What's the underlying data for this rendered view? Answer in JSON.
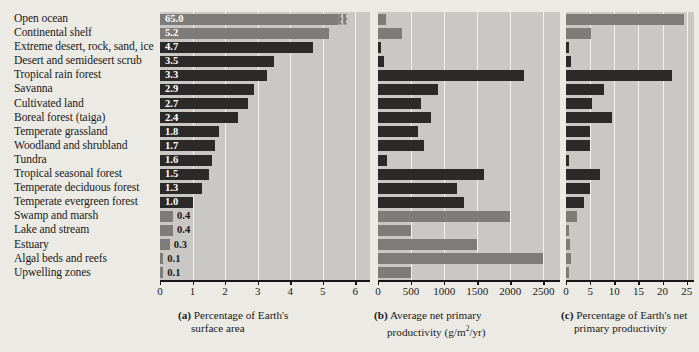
{
  "chart_data": {
    "type": "bar",
    "title": "",
    "orientation": "horizontal",
    "categories": [
      "Open ocean",
      "Continental shelf",
      "Extreme desert, rock, sand, ice",
      "Desert and semidesert scrub",
      "Tropical rain forest",
      "Savanna",
      "Cultivated land",
      "Boreal forest (taiga)",
      "Temperate grassland",
      "Woodland and shrubland",
      "Tundra",
      "Tropical seasonal forest",
      "Temperate deciduous forest",
      "Temperate evergreen forest",
      "Swamp and marsh",
      "Lake and stream",
      "Estuary",
      "Algal beds and reefs",
      "Upwelling zones"
    ],
    "category_types": [
      "aquatic",
      "aquatic",
      "terrestrial",
      "terrestrial",
      "terrestrial",
      "terrestrial",
      "terrestrial",
      "terrestrial",
      "terrestrial",
      "terrestrial",
      "terrestrial",
      "terrestrial",
      "terrestrial",
      "terrestrial",
      "aquatic",
      "aquatic",
      "aquatic",
      "aquatic",
      "aquatic"
    ],
    "panels": [
      {
        "id": "a",
        "caption_line1": "Percentage of Earth's",
        "caption_line2": "surface area",
        "label": "(a)",
        "xlabel": "",
        "xlim": [
          0,
          6.45
        ],
        "ticks": [
          0,
          1,
          2,
          3,
          4,
          5,
          6
        ],
        "tick_labels": [
          "0",
          "1",
          "2",
          "3",
          "4",
          "5",
          "6"
        ],
        "values": [
          65.0,
          5.2,
          4.7,
          3.5,
          3.3,
          2.9,
          2.7,
          2.4,
          1.8,
          1.7,
          1.6,
          1.5,
          1.3,
          1.0,
          0.4,
          0.4,
          0.3,
          0.1,
          0.1
        ],
        "value_labels": [
          "65.0",
          "5.2",
          "4.7",
          "3.5",
          "3.3",
          "2.9",
          "2.7",
          "2.4",
          "1.8",
          "1.7",
          "1.6",
          "1.5",
          "1.3",
          "1.0",
          "0.4",
          "0.4",
          "0.3",
          "0.1",
          "0.1"
        ],
        "truncated_index": 0,
        "truncated_draw_value": 5.75
      },
      {
        "id": "b",
        "caption_line1": "Average net primary",
        "caption_line2": "productivity (g/m2/yr)",
        "label": "(b)",
        "xlabel": "g/m2/yr",
        "xlim": [
          0,
          2750
        ],
        "ticks": [
          0,
          500,
          1000,
          1500,
          2000,
          2500
        ],
        "tick_labels": [
          "0",
          "500",
          "1000",
          "1500",
          "2000",
          "2500"
        ],
        "values": [
          125,
          360,
          3,
          90,
          2200,
          900,
          650,
          800,
          600,
          700,
          140,
          1600,
          1200,
          1300,
          2000,
          500,
          1500,
          2500,
          500
        ]
      },
      {
        "id": "c",
        "caption_line1": "Percentage of Earth's net",
        "caption_line2": "primary productivity",
        "label": "(c)",
        "xlim": [
          0,
          26.5
        ],
        "ticks": [
          0,
          5,
          10,
          15,
          20,
          25
        ],
        "tick_labels": [
          "0",
          "5",
          "10",
          "15",
          "20",
          "25"
        ],
        "values": [
          24.4,
          5.2,
          0.05,
          1.0,
          22.0,
          7.9,
          5.4,
          9.6,
          5.0,
          4.9,
          0.6,
          7.1,
          4.9,
          3.8,
          2.3,
          0.3,
          0.9,
          1.0,
          0.1
        ]
      }
    ],
    "colors": {
      "aquatic_bar": "#7d7c79",
      "terrestrial_bar": "#2b2a28",
      "plot_background": "#c9c8c4",
      "gridline": "#f2f1ee",
      "page_background": "#eceae5",
      "axis": "#171615",
      "value_text": "#ffffff"
    }
  }
}
